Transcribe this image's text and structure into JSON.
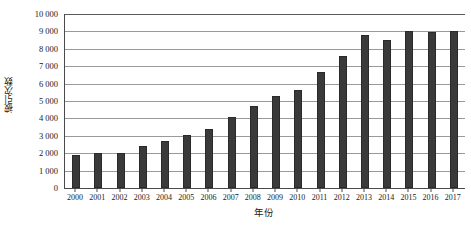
{
  "chart_data": {
    "type": "bar",
    "title": "",
    "xlabel": "年份",
    "ylabel": "被引次数",
    "categories": [
      "2000",
      "2001",
      "2002",
      "2003",
      "2004",
      "2005",
      "2006",
      "2007",
      "2008",
      "2009",
      "2010",
      "2011",
      "2012",
      "2013",
      "2014",
      "2015",
      "2016",
      "2017"
    ],
    "values": [
      1900,
      2000,
      2000,
      2400,
      2700,
      3050,
      3400,
      4100,
      4700,
      5300,
      5650,
      6650,
      7600,
      8800,
      8500,
      9000,
      8950,
      9000
    ],
    "ylim": [
      0,
      10000
    ],
    "ytick_values": [
      0,
      1000,
      2000,
      3000,
      4000,
      5000,
      6000,
      7000,
      8000,
      9000,
      10000
    ],
    "ytick_labels": [
      "0",
      "1 000",
      "2 000",
      "3 000",
      "4 000",
      "5 000",
      "6 000",
      "7 000",
      "8 000",
      "9 000",
      "10 000"
    ],
    "grid": "horizontal",
    "legend": "none",
    "bar_color": "#3a3a3a",
    "gridline_color": "#9a9a9a",
    "axis_color": "#4a4a4a",
    "background_color": "#ffffff"
  }
}
